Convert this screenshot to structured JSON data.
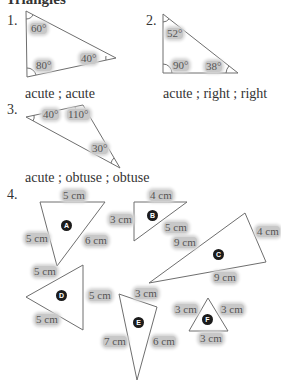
{
  "heading": "Triangles",
  "problems": [
    {
      "number": "1.",
      "angles": [
        "60°",
        "80°",
        "40°"
      ],
      "answer": "acute ; acute"
    },
    {
      "number": "2.",
      "angles": [
        "52°",
        "90°",
        "38°"
      ],
      "answer": "acute ; right ; right"
    },
    {
      "number": "3.",
      "angles": [
        "40°",
        "110°",
        "30°"
      ],
      "answer": "acute ; obtuse ; obtuse"
    },
    {
      "number": "4.",
      "triangles": [
        {
          "id": "A",
          "sides": [
            "5 cm",
            "5 cm",
            "6 cm"
          ]
        },
        {
          "id": "B",
          "sides": [
            "4 cm",
            "3 cm",
            "5 cm"
          ]
        },
        {
          "id": "C",
          "sides": [
            "9 cm",
            "4 cm",
            "9 cm"
          ]
        },
        {
          "id": "D",
          "sides": [
            "5 cm",
            "5 cm",
            "5 cm"
          ]
        },
        {
          "id": "E",
          "sides": [
            "3 cm",
            "7 cm",
            "6 cm"
          ]
        },
        {
          "id": "F",
          "sides": [
            "3 cm",
            "3 cm",
            "3 cm"
          ]
        }
      ]
    }
  ],
  "colors": {
    "line": "#6e6e6e",
    "highlight": "#c8c8c8",
    "badge": "#1b1b1b"
  }
}
